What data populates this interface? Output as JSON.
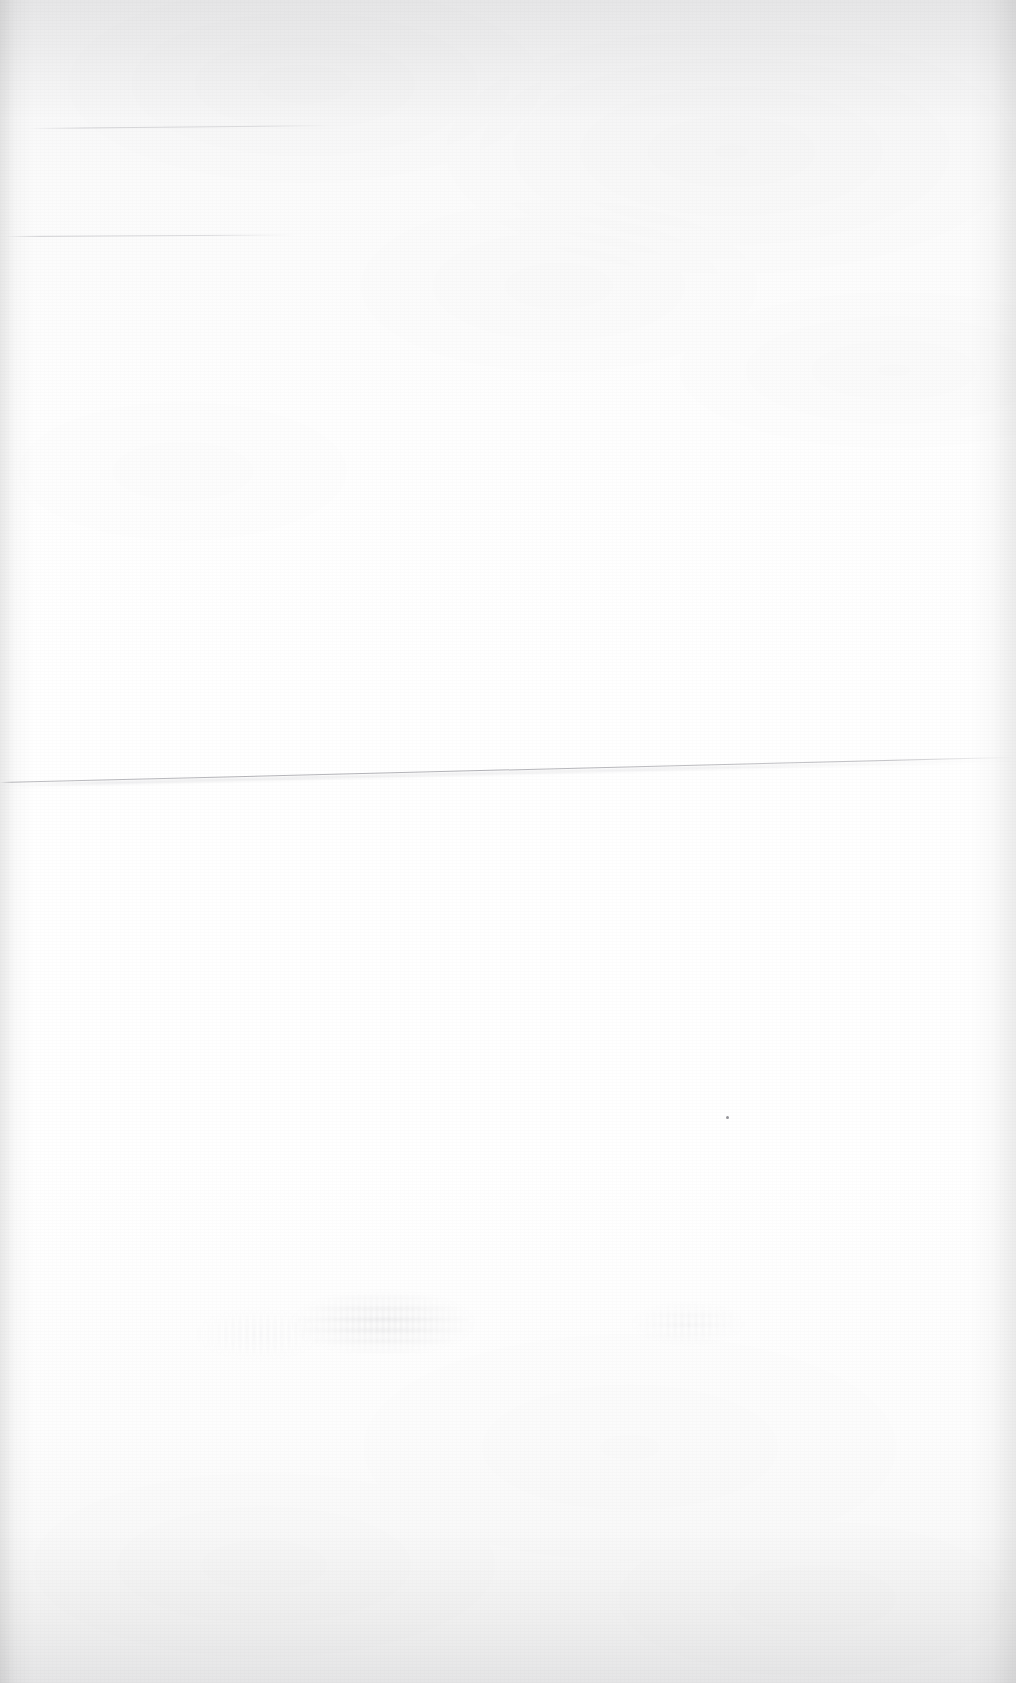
{
  "page": {
    "kind": "scanned-document-page",
    "state": "blank",
    "visible_text": "",
    "width_px": 1016,
    "height_px": 1683,
    "background_color": "#ffffff",
    "paper_tone_color": "#f7f7f8",
    "ink_color": "#5a5a64"
  },
  "artifacts": {
    "fold_line": {
      "name": "fold-crease-line",
      "color": "#6e6e78",
      "start_y_px": 782,
      "end_y_px": 757,
      "angle_deg": -1.42
    },
    "top_line_a": {
      "name": "faint-rule-upper",
      "color": "#6e6e78",
      "y_px": 128,
      "x_px": 30,
      "length_px": 300
    },
    "top_line_b": {
      "name": "faint-rule-lower",
      "color": "#6e6e78",
      "y_px": 236,
      "x_px": 6,
      "length_px": 290
    },
    "speck": {
      "name": "ink-speck",
      "x_px": 726,
      "y_px": 1116,
      "color": "#3c3c46"
    },
    "show_through": {
      "name": "reverse-side-bleed-through",
      "x_px": 268,
      "y_px": 1272,
      "width_px": 230,
      "height_px": 82
    }
  }
}
